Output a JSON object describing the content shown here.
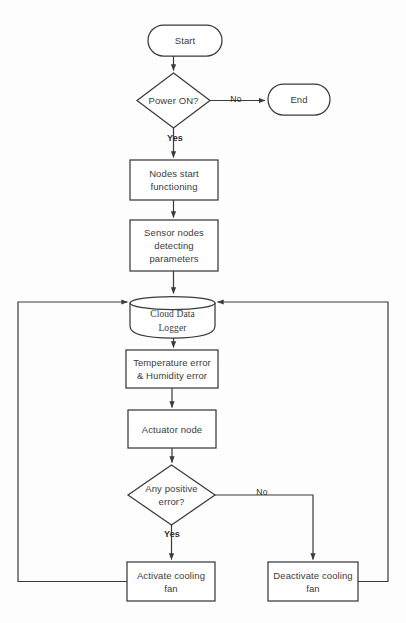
{
  "diagram": {
    "stroke_color": "#3a3a3a",
    "fill_color": "#ffffff",
    "background_color": "#fdfdfd",
    "text_color": "#3b3b3b"
  },
  "nodes": {
    "start": {
      "label": "Start",
      "shape": "terminator"
    },
    "power_on": {
      "label": "Power ON?",
      "shape": "decision"
    },
    "end": {
      "label": "End",
      "shape": "terminator"
    },
    "nodes_start": {
      "label": "Nodes start\nfunctioning",
      "shape": "process"
    },
    "sensor_nodes": {
      "label": "Sensor nodes\ndetecting\nparameters",
      "shape": "process"
    },
    "cloud_logger": {
      "label": "Cloud Data\nLogger",
      "shape": "database"
    },
    "errors": {
      "label": "Temperature error\n& Humidity error",
      "shape": "process"
    },
    "actuator": {
      "label": "Actuator node",
      "shape": "process"
    },
    "any_positive_error": {
      "label": "Any positive\nerror?",
      "shape": "decision"
    },
    "activate_fan": {
      "label": "Activate cooling\nfan",
      "shape": "process"
    },
    "deactivate_fan": {
      "label": "Deactivate cooling\nfan",
      "shape": "process"
    }
  },
  "edge_labels": {
    "power_no": "No",
    "power_yes": "Yes",
    "error_no": "No",
    "error_yes": "Yes"
  }
}
